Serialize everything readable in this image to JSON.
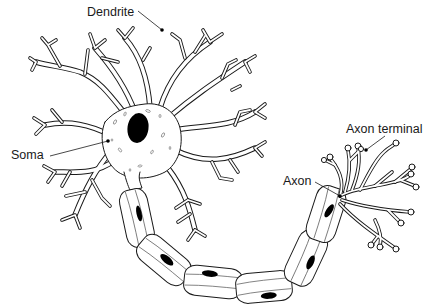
{
  "diagram": {
    "labels": {
      "dendrite": "Dendrite",
      "soma": "Soma",
      "axon": "Axon",
      "axon_terminal": "Axon terminal"
    },
    "colors": {
      "line": "#1a1a1a",
      "background": "#ffffff",
      "nucleus": "#000000"
    },
    "myelin_sheath_segments": 7
  }
}
